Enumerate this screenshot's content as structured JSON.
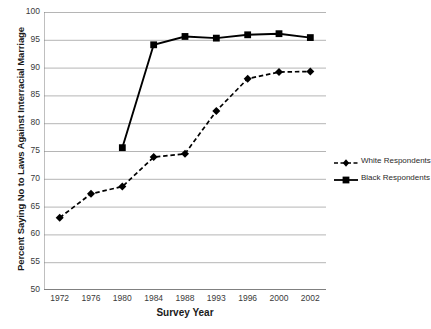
{
  "chart_data": {
    "type": "line",
    "title": "",
    "xlabel": "Survey Year",
    "ylabel": "Percent Saying No to Laws Against Interracial Marriage",
    "categories": [
      "1972",
      "1976",
      "1980",
      "1984",
      "1988",
      "1993",
      "1996",
      "2000",
      "2002"
    ],
    "ylim": [
      50,
      100
    ],
    "y_ticks": [
      100,
      95,
      90,
      85,
      80,
      75,
      70,
      65,
      60,
      55,
      50
    ],
    "grid": "horizontal",
    "legend_position": "right",
    "series": [
      {
        "name": "White Respondents",
        "style": "dashed",
        "marker": "diamond",
        "color": "#000000",
        "values": [
          63.0,
          67.3,
          68.6,
          73.9,
          74.5,
          82.2,
          88.0,
          89.2,
          89.3
        ]
      },
      {
        "name": "Black Respondents",
        "style": "solid",
        "marker": "square",
        "color": "#000000",
        "values": [
          null,
          null,
          75.6,
          94.1,
          95.6,
          95.3,
          95.9,
          96.1,
          95.4
        ]
      }
    ]
  },
  "legend": {
    "items": [
      {
        "label": "White Respondents"
      },
      {
        "label": "Black Respondents"
      }
    ]
  },
  "colors": {
    "axis": "#808080",
    "grid": "#b5b5b5",
    "series": "#000000",
    "background": "#ffffff"
  }
}
